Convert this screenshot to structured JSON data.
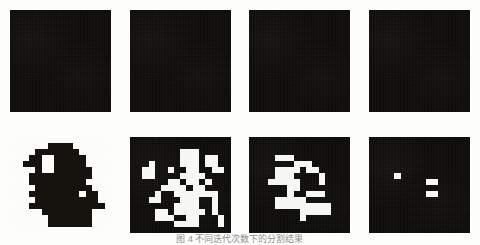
{
  "figure": {
    "caption": "图 4  不同迭代次数下的分割结果",
    "rows": [
      {
        "name": "top-row",
        "panels": [
          {
            "name": "panel-top-1",
            "style": "dark",
            "cols": 16,
            "rows": 16,
            "marks": []
          },
          {
            "name": "panel-top-2",
            "style": "dark",
            "cols": 16,
            "rows": 16,
            "marks": []
          },
          {
            "name": "panel-top-3",
            "style": "dark",
            "cols": 16,
            "rows": 16,
            "marks": []
          },
          {
            "name": "panel-top-4",
            "style": "dark",
            "cols": 16,
            "rows": 16,
            "marks": []
          }
        ]
      },
      {
        "name": "bottom-row",
        "panels": [
          {
            "name": "panel-bottom-1",
            "style": "light",
            "cols": 16,
            "rows": 16,
            "marks": [
              [
                6,
                1
              ],
              [
                7,
                1
              ],
              [
                8,
                1
              ],
              [
                9,
                1
              ],
              [
                4,
                2
              ],
              [
                5,
                2
              ],
              [
                6,
                2
              ],
              [
                7,
                2
              ],
              [
                8,
                2
              ],
              [
                9,
                2
              ],
              [
                10,
                2
              ],
              [
                3,
                3
              ],
              [
                4,
                3
              ],
              [
                7,
                3
              ],
              [
                8,
                3
              ],
              [
                9,
                3
              ],
              [
                10,
                3
              ],
              [
                11,
                3
              ],
              [
                2,
                4
              ],
              [
                3,
                4
              ],
              [
                4,
                4
              ],
              [
                7,
                4
              ],
              [
                8,
                4
              ],
              [
                9,
                4
              ],
              [
                10,
                4
              ],
              [
                11,
                4
              ],
              [
                4,
                5
              ],
              [
                7,
                5
              ],
              [
                8,
                5
              ],
              [
                9,
                5
              ],
              [
                10,
                5
              ],
              [
                11,
                5
              ],
              [
                12,
                5
              ],
              [
                3,
                6
              ],
              [
                4,
                6
              ],
              [
                5,
                6
              ],
              [
                6,
                6
              ],
              [
                7,
                6
              ],
              [
                8,
                6
              ],
              [
                9,
                6
              ],
              [
                10,
                6
              ],
              [
                11,
                6
              ],
              [
                12,
                6
              ],
              [
                3,
                7
              ],
              [
                4,
                7
              ],
              [
                5,
                7
              ],
              [
                6,
                7
              ],
              [
                7,
                7
              ],
              [
                8,
                7
              ],
              [
                9,
                7
              ],
              [
                10,
                7
              ],
              [
                11,
                7
              ],
              [
                4,
                8
              ],
              [
                5,
                8
              ],
              [
                6,
                8
              ],
              [
                7,
                8
              ],
              [
                8,
                8
              ],
              [
                9,
                8
              ],
              [
                10,
                8
              ],
              [
                11,
                8
              ],
              [
                12,
                8
              ],
              [
                3,
                9
              ],
              [
                4,
                9
              ],
              [
                5,
                9
              ],
              [
                6,
                9
              ],
              [
                7,
                9
              ],
              [
                8,
                9
              ],
              [
                9,
                9
              ],
              [
                10,
                9
              ],
              [
                12,
                9
              ],
              [
                13,
                9
              ],
              [
                4,
                10
              ],
              [
                5,
                10
              ],
              [
                6,
                10
              ],
              [
                7,
                10
              ],
              [
                8,
                10
              ],
              [
                9,
                10
              ],
              [
                10,
                10
              ],
              [
                11,
                10
              ],
              [
                12,
                10
              ],
              [
                13,
                10
              ],
              [
                3,
                11
              ],
              [
                4,
                11
              ],
              [
                5,
                11
              ],
              [
                6,
                11
              ],
              [
                7,
                11
              ],
              [
                8,
                11
              ],
              [
                9,
                11
              ],
              [
                10,
                11
              ],
              [
                11,
                11
              ],
              [
                12,
                11
              ],
              [
                13,
                11
              ],
              [
                14,
                11
              ],
              [
                5,
                12
              ],
              [
                6,
                12
              ],
              [
                7,
                12
              ],
              [
                8,
                12
              ],
              [
                9,
                12
              ],
              [
                10,
                12
              ],
              [
                11,
                12
              ],
              [
                12,
                12
              ],
              [
                6,
                13
              ],
              [
                7,
                13
              ],
              [
                8,
                13
              ],
              [
                9,
                13
              ],
              [
                10,
                13
              ],
              [
                11,
                13
              ],
              [
                12,
                13
              ],
              [
                6,
                14
              ],
              [
                7,
                14
              ],
              [
                8,
                14
              ],
              [
                9,
                14
              ],
              [
                10,
                14
              ],
              [
                11,
                14
              ],
              [
                12,
                14
              ]
            ]
          },
          {
            "name": "panel-bottom-2",
            "style": "dark",
            "cols": 16,
            "rows": 16,
            "marks": [
              [
                8,
                2
              ],
              [
                9,
                2
              ],
              [
                10,
                2
              ],
              [
                8,
                3
              ],
              [
                9,
                3
              ],
              [
                10,
                3
              ],
              [
                12,
                3
              ],
              [
                13,
                3
              ],
              [
                3,
                4
              ],
              [
                8,
                4
              ],
              [
                9,
                4
              ],
              [
                10,
                4
              ],
              [
                12,
                4
              ],
              [
                13,
                4
              ],
              [
                2,
                5
              ],
              [
                3,
                5
              ],
              [
                6,
                5
              ],
              [
                9,
                5
              ],
              [
                10,
                5
              ],
              [
                13,
                5
              ],
              [
                14,
                5
              ],
              [
                2,
                6
              ],
              [
                3,
                6
              ],
              [
                8,
                6
              ],
              [
                9,
                6
              ],
              [
                10,
                6
              ],
              [
                11,
                6
              ],
              [
                6,
                7
              ],
              [
                7,
                7
              ],
              [
                9,
                7
              ],
              [
                10,
                7
              ],
              [
                12,
                7
              ],
              [
                5,
                8
              ],
              [
                6,
                8
              ],
              [
                7,
                8
              ],
              [
                8,
                8
              ],
              [
                10,
                8
              ],
              [
                11,
                8
              ],
              [
                4,
                9
              ],
              [
                7,
                9
              ],
              [
                8,
                9
              ],
              [
                9,
                9
              ],
              [
                10,
                9
              ],
              [
                11,
                9
              ],
              [
                12,
                9
              ],
              [
                13,
                9
              ],
              [
                3,
                10
              ],
              [
                4,
                10
              ],
              [
                8,
                10
              ],
              [
                9,
                10
              ],
              [
                10,
                10
              ],
              [
                13,
                10
              ],
              [
                7,
                11
              ],
              [
                8,
                11
              ],
              [
                9,
                11
              ],
              [
                10,
                11
              ],
              [
                13,
                11
              ],
              [
                4,
                12
              ],
              [
                5,
                12
              ],
              [
                7,
                12
              ],
              [
                8,
                12
              ],
              [
                9,
                12
              ],
              [
                10,
                12
              ],
              [
                11,
                12
              ],
              [
                13,
                12
              ],
              [
                4,
                13
              ],
              [
                5,
                13
              ],
              [
                6,
                13
              ],
              [
                9,
                13
              ],
              [
                10,
                13
              ],
              [
                14,
                13
              ],
              [
                7,
                14
              ],
              [
                8,
                14
              ],
              [
                9,
                14
              ],
              [
                10,
                14
              ],
              [
                14,
                14
              ]
            ]
          },
          {
            "name": "panel-bottom-3",
            "style": "dark",
            "cols": 16,
            "rows": 16,
            "marks": [
              [
                4,
                3
              ],
              [
                5,
                3
              ],
              [
                6,
                3
              ],
              [
                7,
                4
              ],
              [
                8,
                4
              ],
              [
                9,
                4
              ],
              [
                4,
                5
              ],
              [
                5,
                5
              ],
              [
                6,
                5
              ],
              [
                7,
                5
              ],
              [
                9,
                5
              ],
              [
                10,
                5
              ],
              [
                4,
                6
              ],
              [
                5,
                6
              ],
              [
                6,
                6
              ],
              [
                11,
                6
              ],
              [
                3,
                7
              ],
              [
                4,
                7
              ],
              [
                5,
                7
              ],
              [
                6,
                7
              ],
              [
                7,
                7
              ],
              [
                11,
                7
              ],
              [
                6,
                8
              ],
              [
                7,
                8
              ],
              [
                6,
                9
              ],
              [
                9,
                9
              ],
              [
                10,
                9
              ],
              [
                11,
                9
              ],
              [
                4,
                10
              ],
              [
                5,
                10
              ],
              [
                6,
                10
              ],
              [
                7,
                10
              ],
              [
                8,
                10
              ],
              [
                4,
                11
              ],
              [
                5,
                11
              ],
              [
                6,
                11
              ],
              [
                7,
                11
              ],
              [
                8,
                11
              ],
              [
                9,
                11
              ],
              [
                10,
                11
              ],
              [
                11,
                11
              ],
              [
                12,
                11
              ],
              [
                8,
                12
              ],
              [
                9,
                12
              ],
              [
                10,
                12
              ],
              [
                11,
                12
              ],
              [
                12,
                12
              ],
              [
                8,
                13
              ]
            ]
          },
          {
            "name": "panel-bottom-4",
            "style": "dark",
            "cols": 16,
            "rows": 16,
            "marks": [
              [
                4,
                6
              ],
              [
                9,
                7
              ],
              [
                10,
                7
              ],
              [
                9,
                9
              ],
              [
                10,
                9
              ]
            ]
          }
        ]
      }
    ]
  }
}
